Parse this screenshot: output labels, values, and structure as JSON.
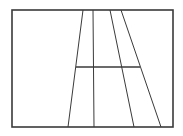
{
  "diagram": {
    "width": 183,
    "height": 136,
    "stroke_color": "#3a3a3a",
    "background": "#ffffff",
    "frame": {
      "x": 12,
      "y": 10,
      "width": 161,
      "height": 117,
      "stroke_width": 1.6
    },
    "lines": [
      {
        "id": "slant-left",
        "x1": 83,
        "y1": 10,
        "x2": 68,
        "y2": 127,
        "stroke_width": 1
      },
      {
        "id": "vertical",
        "x1": 93,
        "y1": 10,
        "x2": 94,
        "y2": 127,
        "stroke_width": 1
      },
      {
        "id": "slant-mid",
        "x1": 110,
        "y1": 10,
        "x2": 134,
        "y2": 127,
        "stroke_width": 1
      },
      {
        "id": "slant-right",
        "x1": 121,
        "y1": 10,
        "x2": 161,
        "y2": 127,
        "stroke_width": 1
      },
      {
        "id": "crossbar",
        "x1": 76,
        "y1": 67,
        "x2": 140,
        "y2": 67,
        "stroke_width": 1.4
      }
    ]
  }
}
